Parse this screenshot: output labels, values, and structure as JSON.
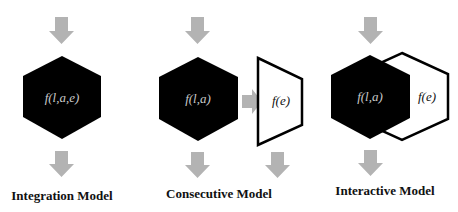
{
  "colors": {
    "arrow": "#b3b3b3",
    "block": "#000000",
    "outline": "#000000",
    "light_text": "#c8c8c8"
  },
  "models": [
    {
      "title": "Integration Model",
      "blocks": [
        {
          "shape": "hexagon",
          "fill": "black",
          "label": "f(l,a,e)"
        }
      ]
    },
    {
      "title": "Consecutive Model",
      "blocks": [
        {
          "shape": "hexagon",
          "fill": "black",
          "label": "f(l,a)"
        },
        {
          "shape": "trapezoid",
          "fill": "white",
          "label": "f(e)"
        }
      ]
    },
    {
      "title": "Interactive Model",
      "blocks": [
        {
          "shape": "hexagon",
          "fill": "black",
          "label": "f(l,a)"
        },
        {
          "shape": "hexagon",
          "fill": "white",
          "label": "f(e)"
        }
      ]
    }
  ]
}
